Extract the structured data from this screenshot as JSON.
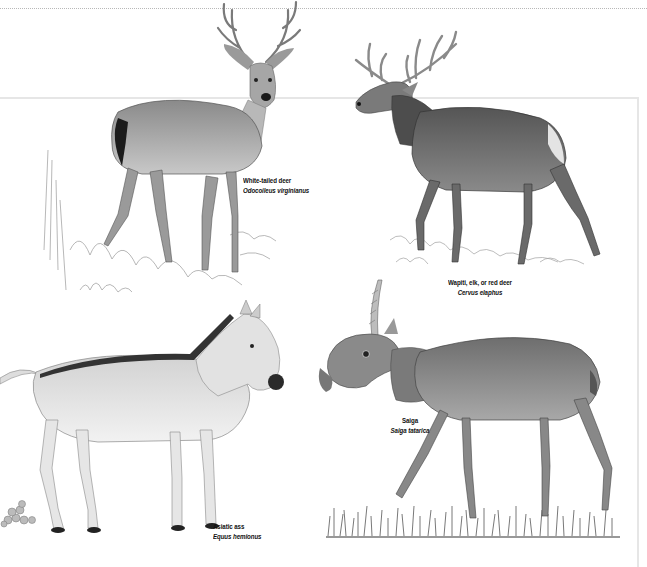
{
  "plate": {
    "frame_color": "#e6e6e6",
    "rule_color": "#b8b8b8",
    "ink_color": "#111111"
  },
  "animals": [
    {
      "id": "white-tailed-deer",
      "common_name": "White-tailed deer",
      "scientific_name": "Odocoileus virginianus"
    },
    {
      "id": "wapiti",
      "common_name": "Wapiti, elk, or red deer",
      "scientific_name": "Cervus elaphus"
    },
    {
      "id": "saiga",
      "common_name": "Saiga",
      "scientific_name": "Saiga tatarica"
    },
    {
      "id": "asiatic-ass",
      "common_name": "Asiatic ass",
      "scientific_name": "Equus hemionus"
    }
  ]
}
